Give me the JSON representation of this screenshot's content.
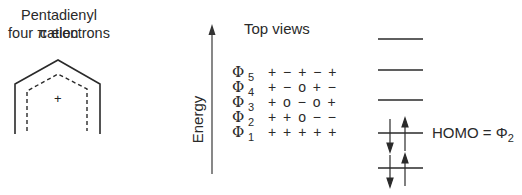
{
  "left_panel": {
    "title_line1": "Pentadienyl cation",
    "title_line2": "four π electrons",
    "charge_symbol": "+"
  },
  "middle_panel": {
    "axis_label": "Energy",
    "header": "Top views",
    "orbitals": [
      {
        "name": "Φ",
        "index": "5",
        "signs": "+ − + − +"
      },
      {
        "name": "Φ",
        "index": "4",
        "signs": "+ − o + −"
      },
      {
        "name": "Φ",
        "index": "3",
        "signs": "+ o − o +"
      },
      {
        "name": "Φ",
        "index": "2",
        "signs": "+ + o − −"
      },
      {
        "name": "Φ",
        "index": "1",
        "signs": "+ + + + +"
      }
    ]
  },
  "right_panel": {
    "levels": 5,
    "occupied_levels": [
      1,
      2
    ],
    "homo_label": "HOMO = Φ",
    "homo_subscript": "2"
  }
}
